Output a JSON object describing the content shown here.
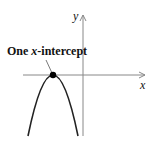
{
  "diagram": {
    "label": {
      "prefix": "One ",
      "var": "x",
      "suffix": "-intercept"
    },
    "axes": {
      "x_label": "x",
      "y_label": "y"
    },
    "curve": {
      "type": "downward-parabola",
      "vertex_on_x_axis": true,
      "color": "#222222"
    },
    "point": {
      "description": "vertex touching x-axis",
      "color": "#000000"
    }
  }
}
